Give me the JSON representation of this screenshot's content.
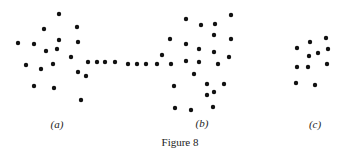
{
  "figure": {
    "caption": "Figure 8",
    "dot_color": "#111111",
    "dot_radius": 2.2,
    "panels": [
      {
        "label": "(a)",
        "label_pos": [
          57,
          120
        ],
        "points": [
          [
            59,
            14
          ],
          [
            44,
            29
          ],
          [
            77,
            27
          ],
          [
            18,
            43
          ],
          [
            34,
            44
          ],
          [
            59,
            40
          ],
          [
            46,
            51
          ],
          [
            57,
            49
          ],
          [
            78,
            42
          ],
          [
            71,
            57
          ],
          [
            26,
            65
          ],
          [
            41,
            69
          ],
          [
            53,
            64
          ],
          [
            78,
            72
          ],
          [
            86,
            76
          ],
          [
            34,
            86
          ],
          [
            54,
            88
          ],
          [
            81,
            100
          ],
          [
            88,
            62
          ],
          [
            97,
            62
          ],
          [
            105,
            62
          ],
          [
            115,
            62
          ]
        ]
      },
      {
        "label": "(b)",
        "label_pos": [
          202,
          119
        ],
        "points": [
          [
            128,
            64
          ],
          [
            137,
            64
          ],
          [
            146,
            64
          ],
          [
            157,
            64
          ],
          [
            162,
            55
          ],
          [
            171,
            64
          ],
          [
            170,
            39
          ],
          [
            186,
            19
          ],
          [
            186,
            44
          ],
          [
            186,
            61
          ],
          [
            201,
            25
          ],
          [
            215,
            24
          ],
          [
            214,
            35
          ],
          [
            231,
            15
          ],
          [
            231,
            39
          ],
          [
            199,
            49
          ],
          [
            214,
            52
          ],
          [
            229,
            57
          ],
          [
            199,
            62
          ],
          [
            218,
            64
          ],
          [
            194,
            74
          ],
          [
            174,
            86
          ],
          [
            207,
            84
          ],
          [
            207,
            95
          ],
          [
            214,
            92
          ],
          [
            224,
            84
          ],
          [
            175,
            108
          ],
          [
            191,
            110
          ],
          [
            213,
            107
          ]
        ]
      },
      {
        "label": "(c)",
        "label_pos": [
          315,
          120
        ],
        "points": [
          [
            297,
            48
          ],
          [
            310,
            42
          ],
          [
            326,
            38
          ],
          [
            309,
            56
          ],
          [
            318,
            53
          ],
          [
            328,
            49
          ],
          [
            297,
            67
          ],
          [
            308,
            67
          ],
          [
            327,
            64
          ],
          [
            296,
            83
          ],
          [
            315,
            85
          ]
        ]
      }
    ],
    "caption_pos": [
      180,
      137
    ]
  }
}
